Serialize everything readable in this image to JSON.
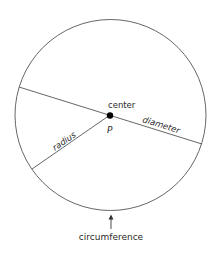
{
  "diagram": {
    "type": "circle-parts",
    "labels": {
      "center": "center",
      "point": "P",
      "radius": "radius",
      "diameter": "diameter",
      "circumference": "circumference"
    },
    "colors": {
      "stroke": "#555555",
      "text": "#2a2a2a",
      "point": "#000000"
    }
  }
}
